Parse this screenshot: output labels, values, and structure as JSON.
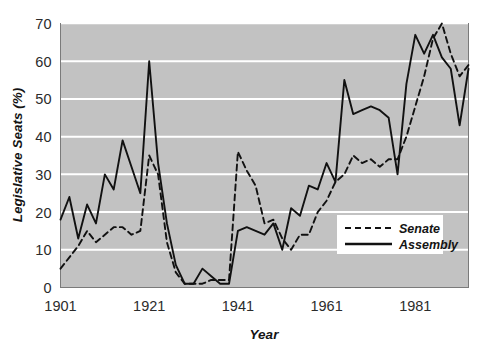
{
  "chart_data": {
    "type": "line",
    "title": "",
    "xlabel": "Year",
    "ylabel": "Legislative Seats (%)",
    "xlim": [
      1901,
      1993
    ],
    "ylim": [
      0,
      70
    ],
    "xticks": [
      1901,
      1921,
      1941,
      1961,
      1981
    ],
    "yticks": [
      0,
      10,
      20,
      30,
      40,
      50,
      60,
      70
    ],
    "grid": "horizontal-white-gridlines",
    "plot_background": "#c2c2c2",
    "legend_position": "lower-right-inside",
    "series": [
      {
        "name": "Senate",
        "style": "dashed",
        "color": "#111111",
        "x": [
          1901,
          1903,
          1905,
          1907,
          1909,
          1911,
          1913,
          1915,
          1917,
          1919,
          1921,
          1923,
          1925,
          1927,
          1929,
          1931,
          1933,
          1935,
          1937,
          1939,
          1941,
          1943,
          1945,
          1947,
          1949,
          1951,
          1953,
          1955,
          1957,
          1959,
          1961,
          1963,
          1965,
          1967,
          1969,
          1971,
          1973,
          1975,
          1977,
          1979,
          1981,
          1983,
          1985,
          1987,
          1989,
          1991,
          1993
        ],
        "values": [
          5,
          8,
          11,
          15,
          12,
          14,
          16,
          16,
          14,
          15,
          35,
          30,
          12,
          4,
          1,
          1,
          1,
          2,
          2,
          2,
          36,
          31,
          27,
          17,
          18,
          13,
          10,
          14,
          14,
          20,
          23,
          28,
          30,
          35,
          33,
          34,
          32,
          34,
          34,
          40,
          48,
          56,
          66,
          70,
          62,
          56,
          59
        ],
        "annotated_points": [
          {
            "year": 1921,
            "value": 35,
            "note": "pre-suffrage-era peak"
          },
          {
            "year": 1929,
            "value": 1,
            "note": "trough"
          },
          {
            "year": 1941,
            "value": 36,
            "note": "wartime peak"
          },
          {
            "year": 1987,
            "value": 70,
            "note": "series maximum"
          }
        ]
      },
      {
        "name": "Assembly",
        "style": "solid",
        "color": "#111111",
        "x": [
          1901,
          1903,
          1905,
          1907,
          1909,
          1911,
          1913,
          1915,
          1917,
          1919,
          1921,
          1923,
          1925,
          1927,
          1929,
          1931,
          1933,
          1935,
          1937,
          1939,
          1941,
          1943,
          1945,
          1947,
          1949,
          1951,
          1953,
          1955,
          1957,
          1959,
          1961,
          1963,
          1965,
          1967,
          1969,
          1971,
          1973,
          1975,
          1977,
          1979,
          1981,
          1983,
          1985,
          1987,
          1989,
          1991,
          1993
        ],
        "values": [
          18,
          24,
          13,
          22,
          17,
          30,
          26,
          39,
          32,
          25,
          60,
          33,
          17,
          6,
          1,
          1,
          5,
          3,
          1,
          1,
          15,
          16,
          15,
          14,
          17,
          10,
          21,
          19,
          27,
          26,
          33,
          28,
          55,
          46,
          47,
          48,
          47,
          45,
          30,
          54,
          67,
          62,
          67,
          61,
          58,
          43,
          58
        ],
        "annotated_points": [
          {
            "year": 1921,
            "value": 60,
            "note": "sharp spike"
          },
          {
            "year": 1929,
            "value": 1,
            "note": "trough"
          },
          {
            "year": 1981,
            "value": 67,
            "note": "high plateau"
          },
          {
            "year": 1991,
            "value": 43,
            "note": "late dip"
          }
        ]
      }
    ]
  },
  "legend": {
    "entries": [
      {
        "label": "Senate",
        "style": "dashed"
      },
      {
        "label": "Assembly",
        "style": "solid"
      }
    ]
  },
  "axes": {
    "y_title": "Legislative Seats (%)",
    "x_title": "Year",
    "y_tick_labels": [
      "70",
      "60",
      "50",
      "40",
      "30",
      "20",
      "10",
      "0"
    ],
    "x_tick_labels": [
      "1901",
      "1921",
      "1941",
      "1961",
      "1981"
    ]
  }
}
